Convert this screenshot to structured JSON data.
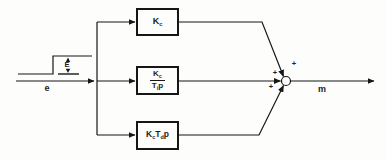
{
  "signals": {
    "input": "e",
    "step_height": "E",
    "output": "m"
  },
  "blocks": {
    "proportional": {
      "base": "K",
      "sub": "c"
    },
    "integral": {
      "num_base": "K",
      "num_sub": "c",
      "den_base": "T",
      "den_sub": "i",
      "den_var": "p"
    },
    "derivative": {
      "gain_base": "K",
      "gain_sub": "c",
      "time_base": "T",
      "time_sub": "d",
      "var": "p"
    }
  },
  "summer": {
    "sign_top": "+",
    "sign_middle": "+",
    "sign_bottom": "+"
  },
  "colors": {
    "ink": "#1c1c1c",
    "paper": "#fdfdfc"
  }
}
